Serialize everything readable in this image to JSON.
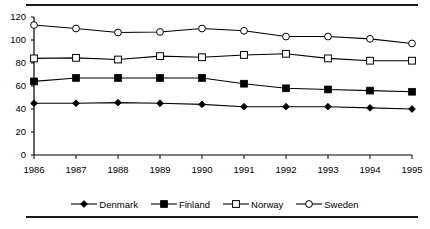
{
  "chart_data": {
    "type": "line",
    "title": "",
    "subtitle": "",
    "xlabel": "",
    "ylabel": "",
    "categories": [
      "1986",
      "1987",
      "1988",
      "1989",
      "1990",
      "1991",
      "1992",
      "1993",
      "1994",
      "1995"
    ],
    "x": [
      1986,
      1987,
      1988,
      1989,
      1990,
      1991,
      1992,
      1993,
      1994,
      1995
    ],
    "xlim": [
      1986,
      1995
    ],
    "ylim": [
      0,
      120
    ],
    "yticks": [
      0,
      20,
      40,
      60,
      80,
      100,
      120
    ],
    "ytick_labels": [
      "0",
      "20",
      "40",
      "60",
      "80",
      "100",
      "120"
    ],
    "xticks": [
      1986,
      1987,
      1988,
      1989,
      1990,
      1991,
      1992,
      1993,
      1994,
      1995
    ],
    "xtick_labels": [
      "1986",
      "1987",
      "1988",
      "1989",
      "1990",
      "1991",
      "1992",
      "1993",
      "1994",
      "1995"
    ],
    "grid": false,
    "legend_position": "bottom-center",
    "series": [
      {
        "name": "Denmark",
        "marker": "filled-diamond",
        "color": "#000000",
        "values": [
          45,
          45,
          45.5,
          45,
          44,
          42,
          42,
          42,
          41,
          40
        ]
      },
      {
        "name": "Finland",
        "marker": "filled-square",
        "color": "#000000",
        "values": [
          64,
          67,
          67,
          67,
          67,
          62,
          58,
          57,
          56,
          55
        ]
      },
      {
        "name": "Norway",
        "marker": "open-square",
        "color": "#000000",
        "values": [
          84,
          84.5,
          83,
          86,
          85,
          87,
          88,
          84,
          82,
          82
        ]
      },
      {
        "name": "Sweden",
        "marker": "open-circle",
        "color": "#000000",
        "values": [
          113,
          110,
          106.5,
          107,
          110,
          108,
          103,
          103,
          101,
          97
        ]
      }
    ]
  },
  "legend": {
    "items": [
      {
        "label": "Denmark",
        "marker": "filled-diamond"
      },
      {
        "label": "Finland",
        "marker": "filled-square"
      },
      {
        "label": "Norway",
        "marker": "open-square"
      },
      {
        "label": "Sweden",
        "marker": "open-circle"
      }
    ]
  },
  "style": {
    "line_color": "#000000",
    "axis_color": "#000000",
    "background": "#ffffff",
    "rule_color": "#1a1a1a"
  }
}
